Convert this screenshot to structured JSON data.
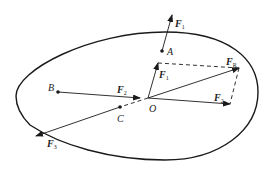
{
  "diagram": {
    "points": [
      {
        "id": "A",
        "label": "A",
        "x": 162,
        "y": 51
      },
      {
        "id": "B",
        "label": "B",
        "x": 58,
        "y": 92
      },
      {
        "id": "C",
        "label": "C",
        "x": 120,
        "y": 107
      },
      {
        "id": "O",
        "label": "O",
        "x": 148,
        "y": 98
      }
    ],
    "forces": {
      "F1_at_A": {
        "base": "F",
        "sub": "1"
      },
      "F2_on_BO": {
        "base": "F",
        "sub": "2"
      },
      "F3_at_C": {
        "base": "F",
        "sub": "3"
      },
      "F1_at_O": {
        "base": "F",
        "sub": "1"
      },
      "F2_at_O": {
        "base": "F",
        "sub": "2"
      },
      "FR": {
        "base": "F",
        "sub": "R"
      }
    },
    "colors": {
      "stroke": "#1a1a1a",
      "background": "#ffffff"
    }
  }
}
